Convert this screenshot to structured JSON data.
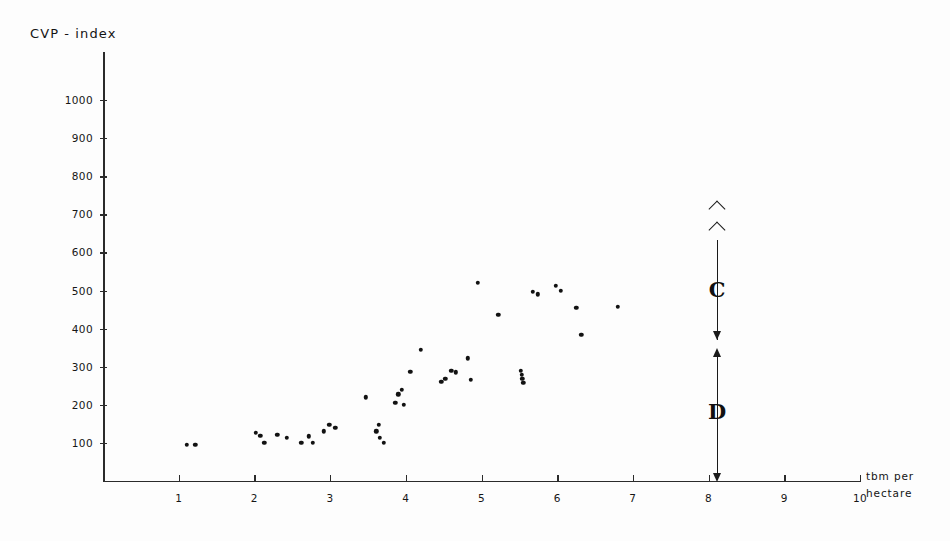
{
  "chart_data": {
    "type": "scatter",
    "title": "",
    "ylabel": "CVP - index",
    "xlabel": "tbm per hectare",
    "xlim": [
      0,
      10
    ],
    "ylim": [
      0,
      1000
    ],
    "grid": false,
    "legend": "none",
    "x_ticks": [
      "1",
      "2",
      "3",
      "4",
      "5",
      "6",
      "7",
      "8",
      "9",
      "10"
    ],
    "x_tick_values": [
      1,
      2,
      3,
      4,
      5,
      6,
      7,
      8,
      9,
      10
    ],
    "y_ticks": [
      "100",
      "200",
      "300",
      "400",
      "500",
      "600",
      "700",
      "800",
      "900",
      "1000"
    ],
    "y_tick_values": [
      100,
      200,
      300,
      400,
      500,
      600,
      700,
      800,
      900,
      1000
    ],
    "points": [
      {
        "x": 1.11,
        "y": 95
      },
      {
        "x": 1.22,
        "y": 95
      },
      {
        "x": 2.02,
        "y": 127
      },
      {
        "x": 2.08,
        "y": 118
      },
      {
        "x": 2.13,
        "y": 100
      },
      {
        "x": 2.3,
        "y": 122
      },
      {
        "x": 2.43,
        "y": 113
      },
      {
        "x": 2.62,
        "y": 100
      },
      {
        "x": 2.72,
        "y": 117
      },
      {
        "x": 2.77,
        "y": 100
      },
      {
        "x": 2.92,
        "y": 130
      },
      {
        "x": 2.99,
        "y": 148
      },
      {
        "x": 3.07,
        "y": 140
      },
      {
        "x": 3.47,
        "y": 220
      },
      {
        "x": 3.61,
        "y": 130
      },
      {
        "x": 3.64,
        "y": 148
      },
      {
        "x": 3.66,
        "y": 113
      },
      {
        "x": 3.71,
        "y": 100
      },
      {
        "x": 3.86,
        "y": 205
      },
      {
        "x": 3.9,
        "y": 228
      },
      {
        "x": 3.95,
        "y": 240
      },
      {
        "x": 3.97,
        "y": 200
      },
      {
        "x": 4.06,
        "y": 287
      },
      {
        "x": 4.2,
        "y": 345
      },
      {
        "x": 4.47,
        "y": 260
      },
      {
        "x": 4.52,
        "y": 268
      },
      {
        "x": 4.6,
        "y": 290
      },
      {
        "x": 4.66,
        "y": 285
      },
      {
        "x": 4.82,
        "y": 322
      },
      {
        "x": 4.86,
        "y": 265
      },
      {
        "x": 4.95,
        "y": 520
      },
      {
        "x": 5.22,
        "y": 437
      },
      {
        "x": 5.52,
        "y": 290
      },
      {
        "x": 5.53,
        "y": 278
      },
      {
        "x": 5.54,
        "y": 268
      },
      {
        "x": 5.55,
        "y": 258
      },
      {
        "x": 5.68,
        "y": 497
      },
      {
        "x": 5.74,
        "y": 490
      },
      {
        "x": 5.98,
        "y": 512
      },
      {
        "x": 6.05,
        "y": 500
      },
      {
        "x": 6.25,
        "y": 455
      },
      {
        "x": 6.32,
        "y": 383
      },
      {
        "x": 6.8,
        "y": 457
      }
    ],
    "annotations": [
      {
        "label": "C",
        "type": "bracket",
        "at_x": 8,
        "y_from": 400,
        "y_to": 620,
        "note": "upper range bracket with arrowheads"
      },
      {
        "label": "D",
        "type": "bracket",
        "at_x": 8,
        "y_from": 0,
        "y_to": 385,
        "note": "lower range bracket with arrowheads"
      }
    ]
  },
  "axes": {
    "y_title": "CVP - index",
    "x_title_line1": "tbm per",
    "x_title_line2": "hectare"
  },
  "colors": {
    "ink": "#1a1a1a",
    "point": "#121212",
    "background": "#fdfdfd"
  }
}
